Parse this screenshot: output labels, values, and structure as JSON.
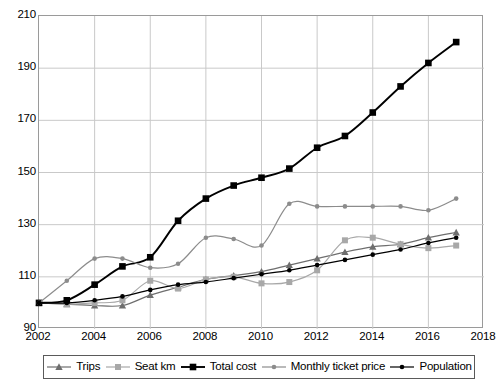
{
  "chart_data": {
    "type": "line",
    "title": "",
    "subtitle": "",
    "xlabel": "",
    "ylabel": "",
    "xlim": [
      2002,
      2018
    ],
    "ylim": [
      90,
      210
    ],
    "yticks": [
      90,
      110,
      130,
      150,
      170,
      190,
      210
    ],
    "xticks": [
      2002,
      2004,
      2006,
      2008,
      2010,
      2012,
      2014,
      2016,
      2018
    ],
    "grid": true,
    "legend_position": "bottom",
    "x": [
      2002,
      2003,
      2004,
      2005,
      2006,
      2007,
      2008,
      2009,
      2010,
      2011,
      2012,
      2013,
      2014,
      2015,
      2016,
      2017
    ],
    "series": [
      {
        "name": "Trips",
        "marker": "triangle",
        "color": "#6e6e6e",
        "values": [
          100,
          99.5,
          99,
          99,
          103,
          106,
          109,
          110.5,
          112,
          114.5,
          117,
          119.5,
          121.5,
          122.5,
          125,
          127
        ]
      },
      {
        "name": "Seat km",
        "marker": "square",
        "color": "#a8a8a8",
        "values": [
          100,
          99.5,
          100,
          101,
          108.5,
          105.5,
          109,
          110,
          107.5,
          108,
          112.5,
          124,
          125,
          122.5,
          121,
          122
        ]
      },
      {
        "name": "Total cost",
        "marker": "square",
        "color": "#000000",
        "values": [
          100,
          101,
          107,
          114,
          117.5,
          131.5,
          140,
          145,
          148,
          151.5,
          159.5,
          164,
          173,
          183,
          192,
          200
        ]
      },
      {
        "name": "Monthly ticket price",
        "marker": "circle",
        "color": "#8c8c8c",
        "values": [
          100,
          108.5,
          117,
          117,
          113.5,
          115,
          125,
          124.5,
          122,
          138,
          137,
          137,
          137,
          137,
          135.5,
          140
        ]
      },
      {
        "name": "Population",
        "marker": "circle",
        "color": "#000000",
        "values": [
          100,
          100,
          101,
          102.5,
          105,
          107,
          108,
          109.5,
          111,
          112.5,
          114.5,
          116.5,
          118.5,
          120.5,
          123,
          125
        ]
      }
    ]
  }
}
